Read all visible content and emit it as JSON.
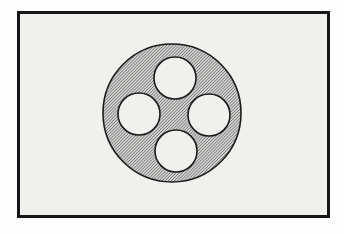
{
  "document": {
    "kind": "technical-line-drawing",
    "title": "Hatched annular disc with four circular holes",
    "canvas": {
      "width": 344,
      "height": 234
    },
    "background_color": "#fdfdfc"
  },
  "frame": {
    "name": "drawing-border",
    "x": 17,
    "y": 11,
    "width": 313,
    "height": 207,
    "stroke_color": "#16161a",
    "stroke_width": 3,
    "fill_color": "#f1f0ed"
  },
  "figure": {
    "label": "sectioned disc",
    "disc": {
      "name": "hatched-disc",
      "cx": 172,
      "cy": 113,
      "r": 69,
      "stroke_color": "#1a1a1d",
      "stroke_width": 1.6,
      "fill_pattern": "diagonal-hatch",
      "hatch_color": "#4a4a4e",
      "hatch_base_color": "#d6d5d2",
      "hatch_spacing": 2,
      "hatch_angle_deg": 45
    },
    "holes": [
      {
        "name": "hole-top",
        "position": "top",
        "cx": 175,
        "cy": 78,
        "r": 21,
        "fill_color": "#f1f0ed",
        "stroke_color": "#1a1a1d",
        "stroke_width": 1.6
      },
      {
        "name": "hole-left",
        "position": "left",
        "cx": 139,
        "cy": 114,
        "r": 21,
        "fill_color": "#f1f0ed",
        "stroke_color": "#1a1a1d",
        "stroke_width": 1.6
      },
      {
        "name": "hole-right",
        "position": "right",
        "cx": 209,
        "cy": 115,
        "r": 21,
        "fill_color": "#f1f0ed",
        "stroke_color": "#1a1a1d",
        "stroke_width": 1.6
      },
      {
        "name": "hole-bottom",
        "position": "bottom",
        "cx": 176,
        "cy": 151,
        "r": 21,
        "fill_color": "#f1f0ed",
        "stroke_color": "#1a1a1d",
        "stroke_width": 1.6
      }
    ]
  }
}
